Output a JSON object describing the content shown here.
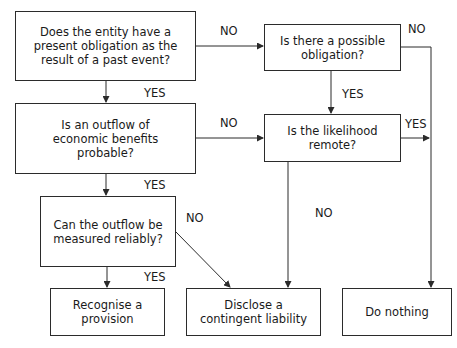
{
  "diagram": {
    "nodes": {
      "present_obligation": "Does the entity have a present obligation as the result of a past event?",
      "possible_obligation": "Is there a possible obligation?",
      "outflow_probable": "Is an outflow of economic benefits probable?",
      "likelihood_remote": "Is the likelihood remote?",
      "measured_reliably": "Can the outflow be measured reliably?",
      "recognise_provision": "Recognise a provision",
      "disclose_contingent": "Disclose a contingent liability",
      "do_nothing": "Do nothing"
    },
    "edges": {
      "q1_no": "NO",
      "q2_no": "NO",
      "q1_yes": "YES",
      "q2_yes": "YES",
      "q3_no": "NO",
      "q4_yes": "YES",
      "q3_yes": "YES",
      "q5_no": "NO",
      "q4_no": "NO",
      "q5_yes": "YES"
    },
    "colors": {
      "line": "#2b2b2b",
      "background": "#ffffff"
    }
  }
}
